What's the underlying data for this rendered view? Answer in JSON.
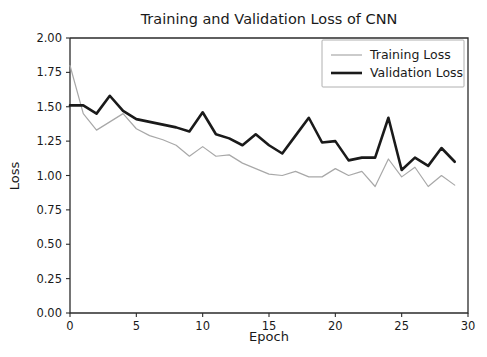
{
  "chart_data": {
    "type": "line",
    "title": "Training and Validation Loss of CNN",
    "xlabel": "Epoch",
    "ylabel": "Loss",
    "xlim": [
      0,
      30
    ],
    "ylim": [
      0.0,
      2.0
    ],
    "xticks": [
      0,
      5,
      10,
      15,
      20,
      25,
      30
    ],
    "xticklabels": [
      "0",
      "5",
      "10",
      "15",
      "20",
      "25",
      "30"
    ],
    "yticks": [
      0.0,
      0.25,
      0.5,
      0.75,
      1.0,
      1.25,
      1.5,
      1.75,
      2.0
    ],
    "yticklabels": [
      "0.00",
      "0.25",
      "0.50",
      "0.75",
      "1.00",
      "1.25",
      "1.50",
      "1.75",
      "2.00"
    ],
    "grid": false,
    "legend_position": "upper right",
    "x": [
      0,
      1,
      2,
      3,
      4,
      5,
      6,
      7,
      8,
      9,
      10,
      11,
      12,
      13,
      14,
      15,
      16,
      17,
      18,
      19,
      20,
      21,
      22,
      23,
      24,
      25,
      26,
      27,
      28,
      29
    ],
    "series": [
      {
        "name": "Training Loss",
        "color": "#a8a8a8",
        "linewidth": 1.2,
        "values": [
          1.8,
          1.45,
          1.33,
          1.39,
          1.45,
          1.34,
          1.29,
          1.26,
          1.22,
          1.14,
          1.21,
          1.14,
          1.15,
          1.09,
          1.05,
          1.01,
          1.0,
          1.03,
          0.99,
          0.99,
          1.05,
          1.0,
          1.03,
          0.92,
          1.12,
          0.99,
          1.06,
          0.92,
          1.0,
          0.93
        ]
      },
      {
        "name": "Validation Loss",
        "color": "#1a1a1a",
        "linewidth": 2.6,
        "values": [
          1.51,
          1.51,
          1.45,
          1.58,
          1.47,
          1.41,
          1.39,
          1.37,
          1.35,
          1.32,
          1.46,
          1.3,
          1.27,
          1.22,
          1.3,
          1.22,
          1.16,
          1.29,
          1.42,
          1.24,
          1.25,
          1.11,
          1.13,
          1.13,
          1.42,
          1.04,
          1.13,
          1.07,
          1.2,
          1.1
        ]
      }
    ]
  },
  "legend": {
    "entries": [
      {
        "label": "Training Loss"
      },
      {
        "label": "Validation Loss"
      }
    ]
  },
  "figure": {
    "background": "#ffffff",
    "axes_color": "#2b2b2b"
  }
}
